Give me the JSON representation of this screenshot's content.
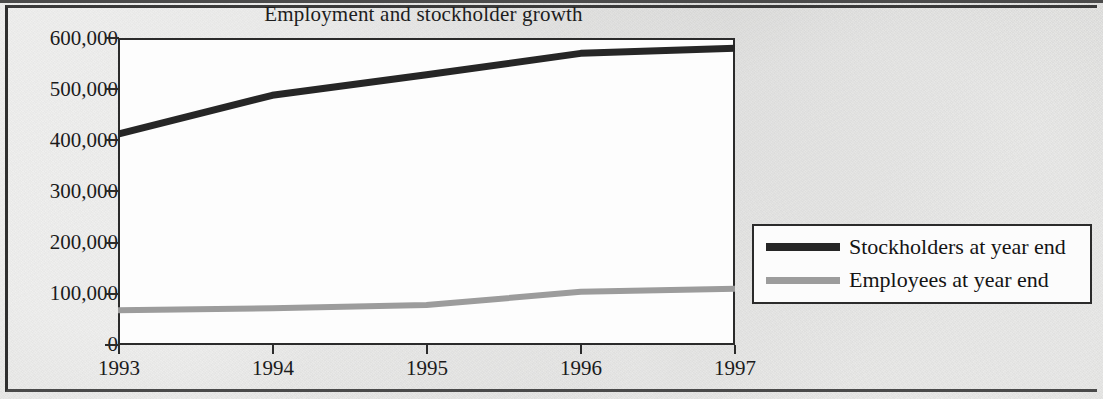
{
  "chart_data": {
    "type": "line",
    "title": "Employment and stockholder growth",
    "xlabel": "",
    "ylabel": "",
    "x": [
      "1993",
      "1994",
      "1995",
      "1996",
      "1997"
    ],
    "categories": [
      "1993",
      "1994",
      "1995",
      "1996",
      "1997"
    ],
    "series": [
      {
        "name": "Stockholders at year end",
        "color": "#262626",
        "values": [
          412000,
          488000,
          528000,
          570000,
          580000
        ]
      },
      {
        "name": "Employees at year end",
        "color": "#9c9c9c",
        "values": [
          68000,
          72000,
          78000,
          104000,
          110000
        ]
      }
    ],
    "ylim": [
      0,
      600000
    ],
    "yticks": [
      0,
      100000,
      200000,
      300000,
      400000,
      500000,
      600000
    ],
    "ytick_labels": [
      "0",
      "100,000",
      "200,000",
      "300,000",
      "400,000",
      "500,000",
      "600,000"
    ],
    "xtick_labels": [
      "1993",
      "1994",
      "1995",
      "1996",
      "1997"
    ],
    "grid": false,
    "legend_position": "right-middle",
    "legend_entries": [
      "Stockholders at year end",
      "Employees at year end"
    ]
  },
  "figure": {
    "background_color": "#d9d9d7",
    "plot_background_color": "#fdfdfd",
    "frame_color": "#2b2b2b"
  }
}
